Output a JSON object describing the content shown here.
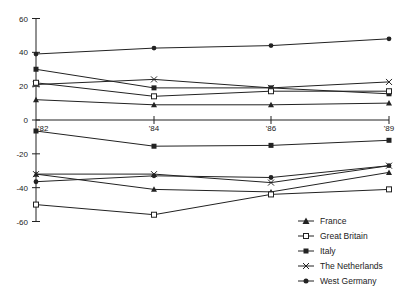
{
  "chart_data": {
    "type": "line",
    "title": "",
    "xlabel": "",
    "ylabel": "",
    "categories": [
      "'82",
      "'84",
      "'86",
      "'89"
    ],
    "yticks": [
      "60",
      "40",
      "20",
      "0",
      "-20",
      "-40",
      "-60"
    ],
    "ylim": [
      -60,
      60
    ],
    "grid": false,
    "legend_position": "lower right",
    "series": [
      {
        "name": "West Germany",
        "marker": "filled-circle",
        "group": "positive",
        "values": [
          39,
          42.5,
          44,
          48
        ]
      },
      {
        "name": "Italy",
        "marker": "filled-square",
        "group": "positive",
        "values": [
          30,
          19,
          19,
          15.5
        ]
      },
      {
        "name": "The Netherlands",
        "marker": "x",
        "group": "positive",
        "values": [
          21,
          24,
          19,
          22.5
        ]
      },
      {
        "name": "Great Britain",
        "marker": "open-square",
        "group": "positive",
        "values": [
          22,
          14,
          17,
          17
        ]
      },
      {
        "name": "France",
        "marker": "triangle",
        "group": "positive",
        "values": [
          12,
          9,
          9,
          10
        ]
      },
      {
        "name": "Italy",
        "marker": "filled-square",
        "group": "negative",
        "values": [
          -6.5,
          -15.5,
          -15,
          -12
        ]
      },
      {
        "name": "The Netherlands",
        "marker": "x",
        "group": "negative",
        "values": [
          -32,
          -32,
          -37,
          -27
        ]
      },
      {
        "name": "West Germany",
        "marker": "filled-circle",
        "group": "negative",
        "values": [
          -36.5,
          -33,
          -34,
          -27
        ]
      },
      {
        "name": "France",
        "marker": "triangle",
        "group": "negative",
        "values": [
          -32,
          -41,
          -42.5,
          -31
        ]
      },
      {
        "name": "Great Britain",
        "marker": "open-square",
        "group": "negative",
        "values": [
          -50,
          -56,
          -44,
          -41
        ]
      }
    ]
  },
  "legend": {
    "items": [
      {
        "label": "France",
        "marker": "triangle"
      },
      {
        "label": "Great Britain",
        "marker": "open-square"
      },
      {
        "label": "Italy",
        "marker": "filled-square"
      },
      {
        "label": "The Netherlands",
        "marker": "x"
      },
      {
        "label": "West Germany",
        "marker": "filled-circle"
      }
    ]
  },
  "colors": {
    "line": "#222222",
    "background": "#ffffff"
  }
}
